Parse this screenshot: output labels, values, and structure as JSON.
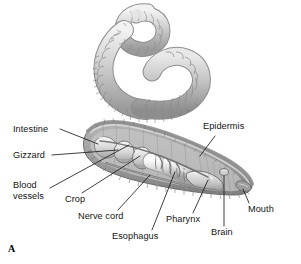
{
  "figure": {
    "panel_letter": "A",
    "background_color": "#ffffff",
    "ink_color": "#141414",
    "body_color": "#b9b9b9"
  },
  "labels": {
    "intestine": "Intestine",
    "gizzard": "Gizzard",
    "blood_vessels_line1": "Blood",
    "blood_vessels_line2": "vessels",
    "crop": "Crop",
    "nerve_cord": "Nerve cord",
    "esophagus": "Esophagus",
    "pharynx": "Pharynx",
    "brain": "Brain",
    "mouth": "Mouth",
    "epidermis": "Epidermis"
  }
}
